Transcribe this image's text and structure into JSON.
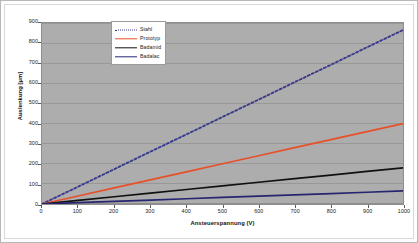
{
  "chart_data": {
    "type": "line",
    "title": "",
    "xlabel": "Ansteuerspannung (V)",
    "ylabel": "Auslenkung [µm]",
    "xlim": [
      0,
      1000
    ],
    "ylim": [
      0,
      900
    ],
    "xticks": [
      0,
      100,
      200,
      300,
      400,
      500,
      600,
      700,
      800,
      900,
      1000
    ],
    "yticks": [
      0,
      100,
      200,
      300,
      400,
      500,
      600,
      700,
      800,
      900
    ],
    "xtick_labels": [
      "0",
      "100",
      "200",
      "300",
      "400",
      "500",
      "600",
      "700",
      "800",
      "900",
      "1000"
    ],
    "ytick_labels": [
      "0",
      "100",
      "200",
      "300",
      "400",
      "500",
      "600",
      "700",
      "800",
      "900"
    ],
    "grid": "horizontal",
    "grid_color": "#8e8e8e",
    "plot_background": "#adadad",
    "legend_position": "top-center-left",
    "x": [
      0,
      100,
      200,
      300,
      400,
      500,
      600,
      700,
      800,
      900,
      1000
    ],
    "series": [
      {
        "name": "Stahl",
        "color": "#3a3a8c",
        "style": "dotted",
        "values": [
          0,
          86,
          173,
          260,
          346,
          433,
          519,
          606,
          692,
          779,
          865
        ]
      },
      {
        "name": "Prototyp",
        "color": "#e8502a",
        "style": "solid",
        "values": [
          0,
          40,
          80,
          120,
          160,
          200,
          240,
          280,
          320,
          360,
          400
        ]
      },
      {
        "name": "Badamid",
        "color": "#111111",
        "style": "solid",
        "values": [
          0,
          18,
          36,
          54,
          72,
          90,
          108,
          126,
          144,
          162,
          180
        ]
      },
      {
        "name": "Badalac",
        "color": "#262670",
        "style": "solid",
        "values": [
          0,
          6.5,
          13,
          19.5,
          26,
          32.5,
          39,
          45.5,
          52,
          58.5,
          65
        ]
      }
    ]
  },
  "legend": {
    "entries": [
      {
        "label": "Stahl"
      },
      {
        "label": "Prototyp"
      },
      {
        "label": "Badamid"
      },
      {
        "label": "Badalac"
      }
    ]
  }
}
